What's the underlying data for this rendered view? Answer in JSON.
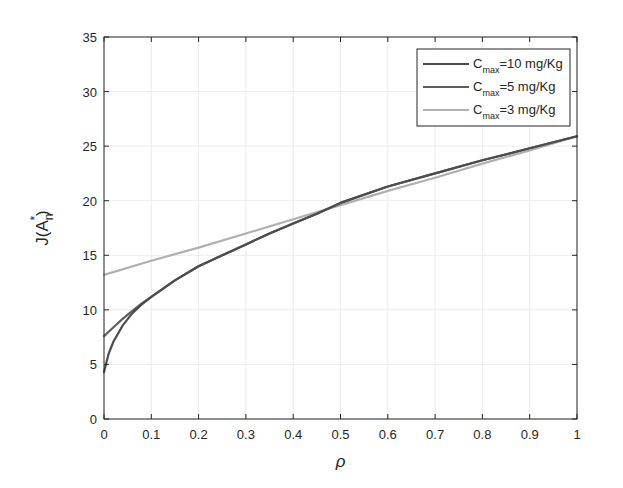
{
  "chart_data": {
    "type": "line",
    "title": "",
    "xlabel": "ρ",
    "ylabel": "J(A_n^*)",
    "ylabel_parts": {
      "base": "J(A",
      "sub": "n",
      "sup": "*",
      "close": ")"
    },
    "xlim": [
      0,
      1
    ],
    "ylim": [
      0,
      35
    ],
    "xticks": [
      0,
      0.1,
      0.2,
      0.3,
      0.4,
      0.5,
      0.6,
      0.7,
      0.8,
      0.9,
      1
    ],
    "xtick_labels": [
      "0",
      "0.1",
      "0.2",
      "0.3",
      "0.4",
      "0.5",
      "0.6",
      "0.7",
      "0.8",
      "0.9",
      "1"
    ],
    "yticks": [
      0,
      5,
      10,
      15,
      20,
      25,
      30,
      35
    ],
    "ytick_labels": [
      "0",
      "5",
      "10",
      "15",
      "20",
      "25",
      "30",
      "35"
    ],
    "grid": true,
    "legend_position": "upper right",
    "series": [
      {
        "name": "C_max=10 mg/Kg",
        "label_base": "C",
        "label_sub": "max",
        "label_rest": "=10 mg/Kg",
        "color": "#4d4d4d",
        "x": [
          0,
          0.01,
          0.02,
          0.04,
          0.06,
          0.08,
          0.1,
          0.15,
          0.2,
          0.25,
          0.3,
          0.35,
          0.4,
          0.45,
          0.5,
          0.6,
          0.7,
          0.8,
          0.9,
          1.0
        ],
        "y": [
          4.3,
          6.0,
          7.1,
          8.6,
          9.7,
          10.5,
          11.2,
          12.7,
          14.0,
          15.0,
          16.0,
          17.0,
          17.9,
          18.8,
          19.8,
          21.3,
          22.5,
          23.7,
          24.8,
          25.9
        ]
      },
      {
        "name": "C_max=5 mg/Kg",
        "label_base": "C",
        "label_sub": "max",
        "label_rest": "=5 mg/Kg",
        "color": "#5f5f5f",
        "x": [
          0,
          0.02,
          0.04,
          0.06,
          0.08,
          0.1,
          0.15,
          0.2,
          0.25,
          0.3,
          0.35,
          0.4,
          0.45,
          0.5,
          0.6,
          0.7,
          0.8,
          0.9,
          1.0
        ],
        "y": [
          7.6,
          8.4,
          9.2,
          9.9,
          10.6,
          11.2,
          12.7,
          14.0,
          15.0,
          16.0,
          17.0,
          17.9,
          18.8,
          19.8,
          21.3,
          22.5,
          23.7,
          24.8,
          25.9
        ]
      },
      {
        "name": "C_max=3 mg/Kg",
        "label_base": "C",
        "label_sub": "max",
        "label_rest": "=3 mg/Kg",
        "color": "#b0b0b0",
        "x": [
          0,
          0.1,
          0.2,
          0.3,
          0.4,
          0.5,
          0.6,
          0.7,
          0.8,
          0.9,
          1.0
        ],
        "y": [
          13.2,
          14.5,
          15.7,
          17.0,
          18.3,
          19.6,
          20.9,
          22.1,
          23.4,
          24.6,
          25.9
        ]
      }
    ]
  },
  "layout": {
    "plot_left": 104,
    "plot_right": 577,
    "plot_top": 37,
    "plot_bottom": 419,
    "legend": {
      "x": 417,
      "y": 49,
      "w": 153,
      "h": 77
    }
  }
}
